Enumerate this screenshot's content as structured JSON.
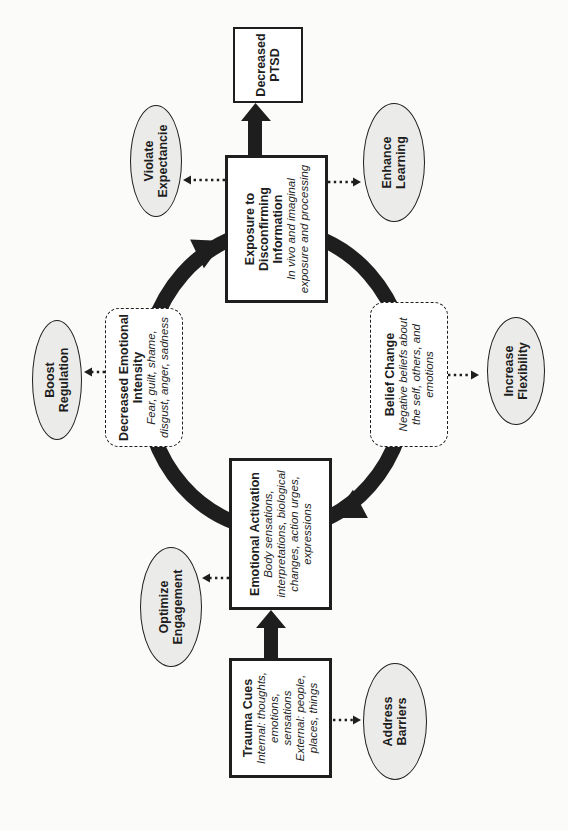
{
  "nodes": {
    "trauma_cues": {
      "title_lines": [
        "Trauma Cues"
      ],
      "body_lines": [
        "Internal: thoughts,",
        "emotions,",
        "sensations",
        "External: people,",
        "places, things"
      ]
    },
    "emotional_activation": {
      "title_lines": [
        "Emotional Activation"
      ],
      "body_lines": [
        "Body sensations,",
        "interpretations, biological",
        "changes, action urges,",
        "expressions"
      ]
    },
    "exposure_disconfirming": {
      "title_lines": [
        "Exposure to",
        "Disconfirming",
        "Information"
      ],
      "body_lines": [
        "In vivo and imaginal",
        "exposure and processing"
      ]
    },
    "decreased_ptsd": {
      "title_lines": [
        "Decreased",
        "PTSD"
      ],
      "body_lines": []
    },
    "decreased_emotional_intensity": {
      "title_lines": [
        "Decreased Emotional",
        "Intensity"
      ],
      "body_lines": [
        "Fear, guilt, shame,",
        "disgust, anger, sadness"
      ]
    },
    "belief_change": {
      "title_lines": [
        "Belief Change"
      ],
      "body_lines": [
        "Negative beliefs about",
        "the self, others, and",
        "emotions"
      ]
    }
  },
  "satellites": {
    "optimize_engagement": {
      "lines": [
        "Optimize",
        "Engagement"
      ]
    },
    "address_barriers": {
      "lines": [
        "Address",
        "Barriers"
      ]
    },
    "boost_regulation": {
      "lines": [
        "Boost",
        "Regulation"
      ]
    },
    "violate_expectancies": {
      "lines": [
        "Violate",
        "Expectancie"
      ]
    },
    "enhance_learning": {
      "lines": [
        "Enhance",
        "Learning"
      ]
    },
    "increase_flexibility": {
      "lines": [
        "Increase",
        "Flexibility"
      ]
    }
  },
  "colors": {
    "ink": "#1e1e1e",
    "node_fill": "#ffffff",
    "satellite_fill": "#ebebe9",
    "page_bg": "#fbfbf9"
  }
}
